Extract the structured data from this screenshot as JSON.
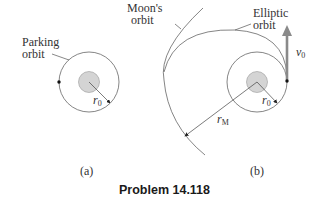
{
  "figure": {
    "title": "Problem 14.118",
    "panel_a": {
      "caption": "(a)",
      "label_line1": "Parking",
      "label_line2": "orbit",
      "radius_symbol": "r",
      "radius_sub": "0"
    },
    "panel_b": {
      "caption": "(b)",
      "moon_label_line1": "Moon's",
      "moon_label_line2": "orbit",
      "elliptic_label_line1": "Elliptic",
      "elliptic_label_line2": "orbit",
      "velocity_symbol": "v",
      "velocity_sub": "0",
      "radius_symbol": "r",
      "radius_sub": "0",
      "moon_radius_symbol": "r",
      "moon_radius_sub": "M"
    },
    "colors": {
      "earth_fill": "#d4d4d4",
      "line": "#555555",
      "arrow": "#8a8a8a"
    }
  }
}
